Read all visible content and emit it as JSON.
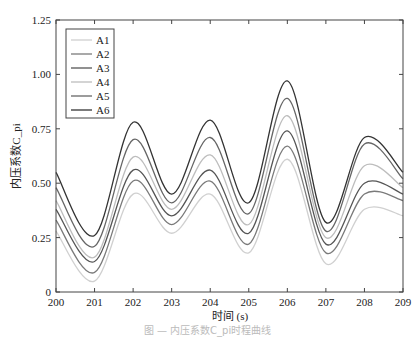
{
  "chart_data": {
    "type": "line",
    "title": "",
    "xlabel": "时间 (s)",
    "ylabel": "内压系数C_pi",
    "xlim": [
      200,
      209
    ],
    "ylim": [
      0,
      1.25
    ],
    "xticks": [
      "200",
      "201",
      "202",
      "203",
      "204",
      "205",
      "206",
      "207",
      "208",
      "209"
    ],
    "yticks": [
      "0",
      "0.25",
      "0.50",
      "0.75",
      "1.00",
      "1.25"
    ],
    "grid": false,
    "legend_position": "upper left",
    "x": [
      200,
      201,
      202,
      203,
      204,
      205,
      206,
      207,
      208,
      209
    ],
    "series": [
      {
        "name": "A1",
        "color": "#d0d0d0",
        "values": [
          0.28,
          0.05,
          0.45,
          0.27,
          0.45,
          0.18,
          0.61,
          0.13,
          0.38,
          0.35
        ]
      },
      {
        "name": "A2",
        "color": "#7a7a7a",
        "values": [
          0.33,
          0.09,
          0.51,
          0.31,
          0.51,
          0.22,
          0.67,
          0.18,
          0.45,
          0.42
        ]
      },
      {
        "name": "A3",
        "color": "#555555",
        "values": [
          0.38,
          0.14,
          0.56,
          0.35,
          0.56,
          0.27,
          0.74,
          0.22,
          0.5,
          0.45
        ]
      },
      {
        "name": "A4",
        "color": "#bdbdbd",
        "values": [
          0.42,
          0.16,
          0.62,
          0.38,
          0.63,
          0.31,
          0.81,
          0.25,
          0.58,
          0.48
        ]
      },
      {
        "name": "A5",
        "color": "#666666",
        "values": [
          0.48,
          0.21,
          0.7,
          0.41,
          0.71,
          0.36,
          0.89,
          0.28,
          0.68,
          0.52
        ]
      },
      {
        "name": "A6",
        "color": "#333333",
        "values": [
          0.55,
          0.26,
          0.78,
          0.45,
          0.79,
          0.41,
          0.97,
          0.32,
          0.71,
          0.55
        ]
      }
    ]
  },
  "caption": "图 — 内压系数C_pi时程曲线"
}
